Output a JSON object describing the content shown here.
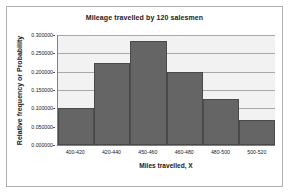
{
  "chart_data": {
    "type": "bar",
    "title": "Mileage travelled by 120 salesmen",
    "xlabel": "Miles travelled, X",
    "ylabel": "Relative frequency or Probability",
    "categories": [
      "400-420",
      "420-440",
      "450-460",
      "460-480",
      "480-500",
      "500-520"
    ],
    "values": [
      0.1,
      0.225,
      0.285,
      0.2,
      0.125,
      0.067
    ],
    "ylim": [
      0.0,
      0.3
    ],
    "ytick_labels": [
      "0.000000",
      "0.050000",
      "0.100000",
      "0.150000",
      "0.200000",
      "0.250000",
      "0.300000"
    ],
    "ytick_values": [
      0.0,
      0.05,
      0.1,
      0.15,
      0.2,
      0.25,
      0.3
    ],
    "grid": true,
    "legend": false,
    "bar_color": "#656565",
    "bar_border_color": "#4a4a4a",
    "plot_background": "#f2f2f2",
    "gridline_color": "#a8a8a8",
    "frame_color": "#b0b0b0"
  }
}
